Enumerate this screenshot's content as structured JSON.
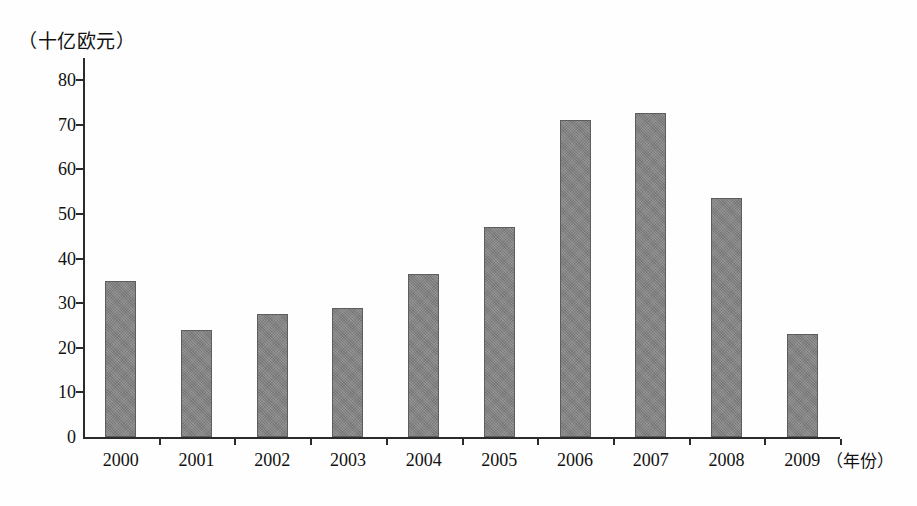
{
  "chart_data": {
    "type": "bar",
    "title": "",
    "subtitle": "",
    "xlabel": "（年份）",
    "ylabel": "（十亿欧元）",
    "categories": [
      "2000",
      "2001",
      "2002",
      "2003",
      "2004",
      "2005",
      "2006",
      "2007",
      "2008",
      "2009"
    ],
    "values": [
      35,
      24,
      27.5,
      29,
      36.5,
      47,
      71,
      72.5,
      53.5,
      23
    ],
    "ylim": [
      0,
      80
    ],
    "y_ticks": [
      0,
      10,
      20,
      30,
      40,
      50,
      60,
      70,
      80
    ],
    "y_tick_labels": [
      "0",
      "10",
      "20",
      "30",
      "40",
      "50",
      "60",
      "70",
      "80"
    ],
    "grid": false,
    "legend": false,
    "legend_position": "none",
    "bar_color": "#818181",
    "bar_border_color": "#5d5d5d",
    "axis_color": "#2b2b2b"
  },
  "axes": {
    "y_unit_caption": "（十亿欧元）",
    "x_unit_caption": "（年份）"
  }
}
